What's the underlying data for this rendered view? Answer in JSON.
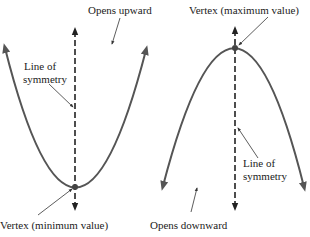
{
  "diagram": {
    "type": "parabola-comparison",
    "colors": {
      "curve": "#555555",
      "axis": "#222222",
      "text": "#222222"
    },
    "left_panel": {
      "description": "Parabola opening upward",
      "labels": {
        "opens": "Opens upward",
        "symmetry_line1": "Line of",
        "symmetry_line2": "symmetry",
        "vertex": "Vertex (minimum value)"
      },
      "vertex": [
        75,
        187
      ],
      "curve_endpoints": [
        [
          5,
          48
        ],
        [
          146,
          50
        ]
      ]
    },
    "right_panel": {
      "description": "Parabola opening downward",
      "labels": {
        "opens": "Opens downward",
        "symmetry_line1": "Line of",
        "symmetry_line2": "symmetry",
        "vertex": "Vertex (maximum value)"
      },
      "vertex": [
        235,
        48
      ],
      "curve_endpoints": [
        [
          163,
          186
        ],
        [
          304,
          187
        ]
      ]
    }
  }
}
